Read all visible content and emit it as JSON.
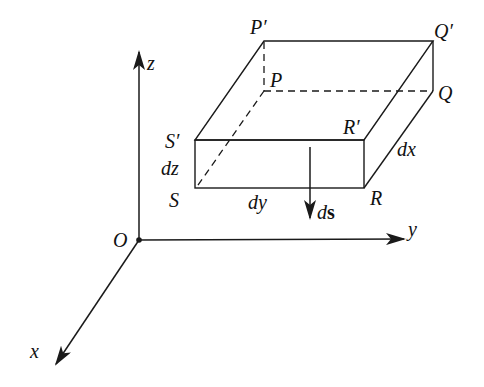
{
  "figure": {
    "axes": {
      "origin": "O",
      "x": "x",
      "y": "y",
      "z": "z"
    },
    "vertices": {
      "P_top": "P",
      "P_prime": "P′",
      "Q": "Q",
      "Q_prime": "Q′",
      "R": "R",
      "R_prime": "R′",
      "S": "S",
      "S_prime": "S′"
    },
    "dimensions": {
      "dx": "dx",
      "dy": "dy",
      "dz": "dz"
    },
    "vector": {
      "d": "d",
      "s": "s"
    },
    "colors": {
      "line": "#1a1a1a",
      "background": "#ffffff"
    }
  }
}
